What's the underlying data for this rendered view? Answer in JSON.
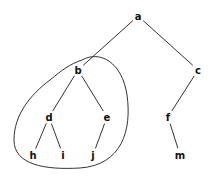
{
  "diagram": {
    "type": "tree",
    "nodes": [
      {
        "id": "a",
        "label": "a",
        "x": 138,
        "y": 16
      },
      {
        "id": "b",
        "label": "b",
        "x": 78,
        "y": 70
      },
      {
        "id": "c",
        "label": "c",
        "x": 198,
        "y": 70
      },
      {
        "id": "d",
        "label": "d",
        "x": 49,
        "y": 117
      },
      {
        "id": "e",
        "label": "e",
        "x": 107,
        "y": 117
      },
      {
        "id": "f",
        "label": "f",
        "x": 168,
        "y": 117
      },
      {
        "id": "h",
        "label": "h",
        "x": 33,
        "y": 155
      },
      {
        "id": "i",
        "label": "i",
        "x": 63,
        "y": 155
      },
      {
        "id": "j",
        "label": "j",
        "x": 93,
        "y": 155
      },
      {
        "id": "m",
        "label": "m",
        "x": 180,
        "y": 155
      }
    ],
    "edges": [
      [
        "a",
        "b"
      ],
      [
        "a",
        "c"
      ],
      [
        "b",
        "d"
      ],
      [
        "b",
        "e"
      ],
      [
        "c",
        "f"
      ],
      [
        "d",
        "h"
      ],
      [
        "d",
        "i"
      ],
      [
        "e",
        "j"
      ],
      [
        "f",
        "m"
      ]
    ],
    "highlighted_subtree_root": "b"
  }
}
